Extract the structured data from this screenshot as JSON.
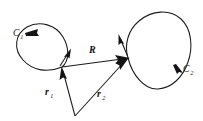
{
  "figure": {
    "background_color": "#ffffff",
    "ink_color": "#1a1a1a",
    "width": 203,
    "height": 121
  },
  "labels": {
    "curve_left": {
      "base": "C",
      "sub": "1"
    },
    "curve_right": {
      "base": "C",
      "sub": "2"
    },
    "vector_separation": {
      "base": "R",
      "sub": ""
    },
    "vector_r1": {
      "base": "r",
      "sub": "1"
    },
    "vector_r2": {
      "base": "r",
      "sub": "2"
    }
  },
  "geometry": {
    "origin_point": {
      "x": 75,
      "y": 116
    },
    "point_on_c1": {
      "x": 62,
      "y": 67
    },
    "point_on_c2": {
      "x": 128,
      "y": 58
    },
    "curve_left_path": "M 62 67 C 48 73 33 71 23 60 C 13 49 15 34 27 27 C 40 20 56 25 63 37 C 69 47 70 60 62 67 Z",
    "curve_right_path": "M 128 58 C 124 45 128 30 139 21 C 152 10 170 9 181 19 C 192 29 193 48 188 62 C 183 77 172 88 158 89 C 144 90 132 74 128 58 Z",
    "vector_R": {
      "from": {
        "x": 62,
        "y": 67
      },
      "to": {
        "x": 128,
        "y": 58
      }
    },
    "vector_r1": {
      "from": {
        "x": 75,
        "y": 116
      },
      "to": {
        "x": 62,
        "y": 67
      }
    },
    "vector_r2": {
      "from": {
        "x": 75,
        "y": 116
      },
      "to": {
        "x": 128,
        "y": 58
      }
    },
    "tick_c1": {
      "from": {
        "x": 60,
        "y": 66
      },
      "to": {
        "x": 71,
        "y": 49
      }
    },
    "tick_c2": {
      "from": {
        "x": 128,
        "y": 57
      },
      "to": {
        "x": 118,
        "y": 34
      }
    },
    "arrow_c1_direction": "counterclockwise",
    "arrow_c2_direction": "clockwise"
  },
  "label_positions": {
    "curve_left": {
      "x": 13,
      "y": 36
    },
    "curve_right": {
      "x": 183,
      "y": 72
    },
    "vector_separation": {
      "x": 89,
      "y": 53
    },
    "vector_r1": {
      "x": 45,
      "y": 95
    },
    "vector_r2": {
      "x": 97,
      "y": 97
    }
  }
}
